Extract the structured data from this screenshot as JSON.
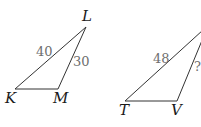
{
  "triangles": [
    {
      "name": "KLM",
      "vertices": {
        "L": "L",
        "K": "K",
        "M": "M"
      },
      "sides": {
        "KL": "40",
        "LM": "30"
      }
    },
    {
      "name": "TV",
      "vertices": {
        "T": "T",
        "V": "V"
      },
      "sides": {
        "T_top": "48",
        "V_top": "?"
      }
    }
  ]
}
